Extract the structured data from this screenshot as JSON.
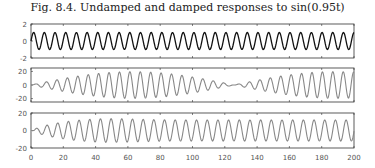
{
  "title": "Fig. 8.4.  Undamped and damped responses to sin(0.95t)",
  "chart_data": [
    {
      "type": "line",
      "title": "Fig. 8.4. Undamped and damped responses to sin(0.95t)",
      "series": [
        {
          "name": "sin(0.95t)",
          "formula": "sin(0.95*t)",
          "color": "#111111"
        }
      ],
      "xlim": [
        0,
        200
      ],
      "ylim": [
        -2,
        2
      ],
      "yticks": [
        -2,
        0,
        2
      ],
      "xticks": [
        0,
        20,
        40,
        60,
        80,
        100,
        120,
        140,
        160,
        180,
        200
      ]
    },
    {
      "type": "line",
      "series": [
        {
          "name": "undamped response (beats)",
          "color": "#888888"
        }
      ],
      "xlim": [
        0,
        200
      ],
      "ylim": [
        -25,
        25
      ],
      "yticks": [
        -20,
        0,
        20
      ],
      "xticks": [
        0,
        20,
        40,
        60,
        80,
        100,
        120,
        140,
        160,
        180,
        200
      ]
    },
    {
      "type": "line",
      "series": [
        {
          "name": "damped response",
          "color": "#888888"
        }
      ],
      "xlim": [
        0,
        200
      ],
      "ylim": [
        -20,
        20
      ],
      "yticks": [
        -20,
        0,
        20
      ],
      "xticks": [
        0,
        20,
        40,
        60,
        80,
        100,
        120,
        140,
        160,
        180,
        200
      ],
      "xtick_labels": [
        "0",
        "20",
        "40",
        "60",
        "80",
        "100",
        "120",
        "140",
        "160",
        "180",
        "200"
      ]
    }
  ]
}
